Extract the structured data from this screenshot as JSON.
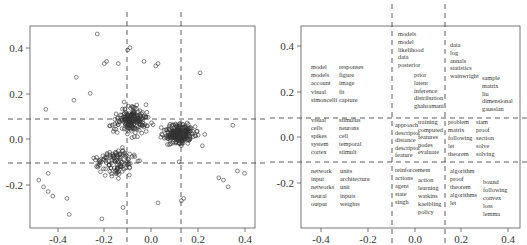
{
  "chart_data": [
    {
      "type": "scatter",
      "title": "",
      "xlabel": "",
      "ylabel": "",
      "xlim": [
        -0.52,
        0.43
      ],
      "ylim": [
        -0.43,
        0.48
      ],
      "x_ticks": [
        "-0.4",
        "-0.2",
        "0.0",
        "0.2",
        "0.4"
      ],
      "y_ticks": [
        "-0.2",
        "0.0",
        "0.2",
        "0.4"
      ],
      "grid": false,
      "marker": "open-circle",
      "partition_lines": {
        "vertical_x": [
          -0.1,
          0.13
        ],
        "horizontal_y": [
          0.09,
          -0.1
        ]
      },
      "description": "Approximately 600 open-circle points forming a triangular cloud; densest around x 0.0–0.25, y -0.05–0.1; sparse tail toward lower-left (x -0.48, y -0.18); max y ~0.46 near x -0.23.",
      "sample_points": [
        {
          "x": -0.23,
          "y": 0.46
        },
        {
          "x": -0.1,
          "y": 0.39
        },
        {
          "x": -0.09,
          "y": 0.4
        },
        {
          "x": -0.2,
          "y": 0.33
        },
        {
          "x": -0.19,
          "y": 0.34
        },
        {
          "x": -0.14,
          "y": 0.33
        },
        {
          "x": -0.03,
          "y": 0.34
        },
        {
          "x": 0.02,
          "y": 0.32
        },
        {
          "x": 0.03,
          "y": 0.33
        },
        {
          "x": 0.21,
          "y": 0.29
        },
        {
          "x": -0.32,
          "y": 0.27
        },
        {
          "x": -0.26,
          "y": 0.2
        },
        {
          "x": -0.33,
          "y": 0.17
        },
        {
          "x": -0.45,
          "y": 0.13
        },
        {
          "x": -0.48,
          "y": -0.18
        },
        {
          "x": -0.46,
          "y": -0.21
        },
        {
          "x": -0.44,
          "y": -0.23
        },
        {
          "x": -0.42,
          "y": -0.25
        },
        {
          "x": -0.44,
          "y": -0.15
        },
        {
          "x": -0.36,
          "y": -0.26
        },
        {
          "x": -0.35,
          "y": -0.33
        },
        {
          "x": -0.21,
          "y": -0.35
        },
        {
          "x": -0.12,
          "y": -0.3
        },
        {
          "x": 0.03,
          "y": -0.28
        },
        {
          "x": 0.13,
          "y": -0.27
        },
        {
          "x": 0.14,
          "y": -0.26
        },
        {
          "x": 0.29,
          "y": -0.17
        },
        {
          "x": 0.31,
          "y": -0.18
        },
        {
          "x": 0.33,
          "y": -0.21
        },
        {
          "x": 0.4,
          "y": -0.15
        },
        {
          "x": 0.37,
          "y": -0.14
        },
        {
          "x": 0.35,
          "y": 0.06
        },
        {
          "x": 0.23,
          "y": 0.02
        },
        {
          "x": 0.22,
          "y": -0.03
        },
        {
          "x": 0.12,
          "y": -0.1
        }
      ]
    },
    {
      "type": "scatter",
      "subtype": "word-cluster-map",
      "title": "",
      "xlabel": "",
      "ylabel": "",
      "xlim": [
        -0.52,
        0.43
      ],
      "ylim": [
        -0.43,
        0.48
      ],
      "x_ticks": [
        "-0.4",
        "-0.2",
        "0.0",
        "0.2",
        "0.4"
      ],
      "y_ticks": [
        "-0.2",
        "0.0",
        "0.2",
        "0.4"
      ],
      "grid": false,
      "partition_lines": {
        "vertical_x": [
          -0.1,
          0.13
        ],
        "horizontal_y": [
          0.09,
          -0.1
        ]
      },
      "clusters": [
        {
          "cell": "top-left",
          "columns": [
            [
              "model",
              "models",
              "account",
              "visual",
              "simoncelli"
            ],
            [
              "responses",
              "figure",
              "image",
              "fit",
              "capture"
            ]
          ]
        },
        {
          "cell": "top-middle",
          "columns": [
            [
              "models",
              "model",
              "likelihood",
              "data",
              "posterior"
            ],
            [
              "prior",
              "latent",
              "inference",
              "distribution",
              "ghahramani"
            ]
          ]
        },
        {
          "cell": "top-right",
          "columns": [
            [
              "data",
              "log",
              "annals",
              "statistics",
              "wainwright"
            ],
            [
              "sample",
              "matrix",
              "liu",
              "dimensional",
              "gaussian"
            ]
          ]
        },
        {
          "cell": "middle-left",
          "columns": [
            [
              "visual",
              "cells",
              "spikes",
              "system",
              "cortex"
            ],
            [
              "stimulus",
              "neurons",
              "cell",
              "temporal",
              "stimuli"
            ]
          ]
        },
        {
          "cell": "middle-middle",
          "columns": [
            [
              "approach",
              "descriptor",
              "distance",
              "descriptor",
              "feature"
            ],
            [
              "training",
              "computed",
              "features",
              "nodes",
              "evaluate"
            ]
          ]
        },
        {
          "cell": "middle-right",
          "columns": [
            [
              "problem",
              "matrix",
              "following",
              "let",
              "theorem"
            ],
            [
              "siam",
              "proof",
              "section",
              "solve",
              "solving"
            ]
          ]
        },
        {
          "cell": "bottom-left",
          "columns": [
            [
              "network",
              "input",
              "networks",
              "neural",
              "output"
            ],
            [
              "units",
              "architecture",
              "unit",
              "inputs",
              "weights"
            ]
          ]
        },
        {
          "cell": "bottom-middle",
          "columns": [
            [
              "reinforcement",
              "actions",
              "agent",
              "state",
              "singh"
            ],
            [
              "action",
              "learning",
              "watkins",
              "kaelbling",
              "policy"
            ]
          ]
        },
        {
          "cell": "bottom-right",
          "columns": [
            [
              "algorithm",
              "proof",
              "theorem",
              "algorithms",
              "let"
            ],
            [
              "bound",
              "following",
              "convex",
              "loss",
              "lemma"
            ]
          ]
        }
      ]
    }
  ],
  "left_plot": {
    "x_ticks": [
      "-0.4",
      "-0.2",
      "0.0",
      "0.2",
      "0.4"
    ],
    "y_ticks": [
      "0.4",
      "0.2",
      "0.0",
      "-0.2"
    ]
  },
  "right_plot": {
    "x_ticks": [
      "-0.4",
      "-0.2",
      "0.0",
      "0.2",
      "0.4"
    ],
    "y_ticks": [
      "0.4",
      "0.2",
      "0.0",
      "-0.2"
    ],
    "words": {
      "tl_a": [
        "model",
        "models",
        "account",
        "visual",
        "simoncelli"
      ],
      "tl_b": [
        "responses",
        "figure",
        "image",
        "fit",
        "capture"
      ],
      "tm_a": [
        "models",
        "model",
        "likelihood",
        "data",
        "posterior"
      ],
      "tm_b": [
        "prior",
        "latent",
        "inference",
        "distribution",
        "ghahramani"
      ],
      "tr_a": [
        "data",
        "log",
        "annals",
        "statistics",
        "wainwright"
      ],
      "tr_b": [
        "sample",
        "matrix",
        "liu",
        "dimensional",
        "gaussian"
      ],
      "ml_a": [
        "visual",
        "cells",
        "spikes",
        "system",
        "cortex"
      ],
      "ml_b": [
        "stimulus",
        "neurons",
        "cell",
        "temporal",
        "stimuli"
      ],
      "mm_a": [
        "approach",
        "descriptor",
        "distance",
        "descriptor",
        "feature"
      ],
      "mm_b": [
        "training",
        "computed",
        "features",
        "nodes",
        "evaluate"
      ],
      "mr_a": [
        "problem",
        "matrix",
        "following",
        "let",
        "theorem"
      ],
      "mr_b": [
        "siam",
        "proof",
        "section",
        "solve",
        "solving"
      ],
      "bl_a": [
        "network",
        "input",
        "networks",
        "neural",
        "output"
      ],
      "bl_b": [
        "units",
        "architecture",
        "unit",
        "inputs",
        "weights"
      ],
      "bm_a": [
        "reinforcement",
        "actions",
        "agent",
        "state",
        "singh"
      ],
      "bm_b": [
        "action",
        "learning",
        "watkins",
        "kaelbling",
        "policy"
      ],
      "br_a": [
        "algorithm",
        "proof",
        "theorem",
        "algorithms",
        "let"
      ],
      "br_b": [
        "bound",
        "following",
        "convex",
        "loss",
        "lemma"
      ]
    }
  }
}
